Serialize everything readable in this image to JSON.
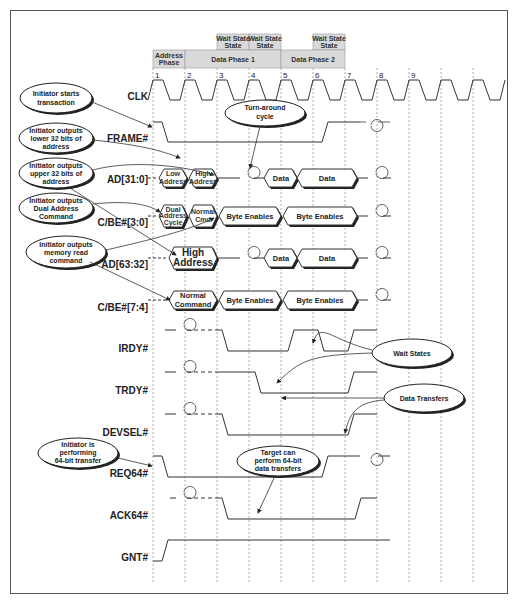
{
  "diagram": {
    "phases": {
      "address_phase": "Address Phase",
      "data_phase_1": "Data Phase 1",
      "data_phase_2": "Data Phase 2",
      "wait_state": "Wait State"
    },
    "clock_numbers": [
      "1",
      "2",
      "3",
      "4",
      "5",
      "6",
      "7",
      "8",
      "9"
    ],
    "signals": {
      "clk": "CLK",
      "frame": "FRAME#",
      "ad_low": "AD[31:0]",
      "cbe_low": "C/BE#[3:0]",
      "ad_high": "AD[63:32]",
      "cbe_high": "C/BE#[7:4]",
      "irdy": "IRDY#",
      "trdy": "TRDY#",
      "devsel": "DEVSEL#",
      "req64": "REQ64#",
      "ack64": "ACK64#",
      "gnt": "GNT#"
    },
    "bus_values": {
      "ad_low": [
        "Low",
        "Address",
        "High",
        "Address",
        "Data",
        "Data"
      ],
      "cbe_low": [
        "Dual",
        "Address",
        "Cycle",
        "Normal",
        "Cmd",
        "Byte Enables",
        "Byte Enables"
      ],
      "ad_high": [
        "High",
        "Address",
        "Data",
        "Data"
      ],
      "cbe_high": [
        "Normal",
        "Command",
        "Byte Enables",
        "Byte Enables"
      ]
    },
    "callouts": {
      "starts": [
        "Initiator starts",
        "transaction"
      ],
      "lower32": [
        "Initiator outputs",
        "lower 32 bits of",
        "address"
      ],
      "upper32": [
        "Initiator outputs",
        "upper 32 bits of",
        "address"
      ],
      "dual": [
        "Initiator outputs",
        "Dual Address",
        "Command"
      ],
      "memread": [
        "Initiator outputs",
        "memory read",
        "command"
      ],
      "turnaround": [
        "Turn-around",
        "cycle"
      ],
      "wait": [
        "Wait States"
      ],
      "transfers": [
        "Data Transfers"
      ],
      "perf64": [
        "Initiator is",
        "performing",
        "64-bit transfer"
      ],
      "target64": [
        "Target can",
        "perform 64-bit",
        "data transfers"
      ]
    },
    "colors": {
      "header_fill": "#d9d9d9",
      "line": "#333333",
      "grid": "#888888"
    }
  }
}
